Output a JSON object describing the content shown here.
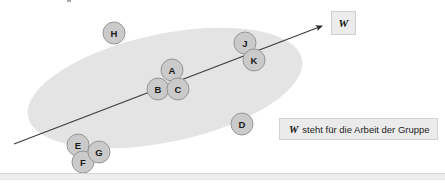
{
  "figure": {
    "type": "group-work-diagram",
    "background_color": "#ffffff",
    "group_region": {
      "shape": "ellipse",
      "name": "group-ellipse",
      "fill_color": "#e4e4e4",
      "center_x": 165,
      "center_y": 88,
      "radius_x": 140,
      "radius_y": 54,
      "rotation_deg": -12
    },
    "arrow": {
      "name": "work-vector-arrow",
      "label": "W",
      "color": "#3a3a3a",
      "start_x": 14,
      "start_y": 144,
      "end_x": 322,
      "end_y": 26
    },
    "nodes": [
      {
        "label": "H",
        "x": 114,
        "y": 33,
        "r": 11
      },
      {
        "label": "J",
        "x": 245,
        "y": 43,
        "r": 11
      },
      {
        "label": "K",
        "x": 254,
        "y": 60,
        "r": 11
      },
      {
        "label": "A",
        "x": 172,
        "y": 70,
        "r": 11
      },
      {
        "label": "B",
        "x": 158,
        "y": 89,
        "r": 11
      },
      {
        "label": "C",
        "x": 178,
        "y": 89,
        "r": 11
      },
      {
        "label": "D",
        "x": 242,
        "y": 124,
        "r": 11
      },
      {
        "label": "E",
        "x": 78,
        "y": 145,
        "r": 11
      },
      {
        "label": "F",
        "x": 83,
        "y": 162,
        "r": 11
      },
      {
        "label": "G",
        "x": 99,
        "y": 152,
        "r": 11
      }
    ],
    "node_style": {
      "fill_color": "#cacaca",
      "stroke_color": "#8f8f8f",
      "text_color": "#1a1a1a"
    }
  },
  "w_badge": {
    "name": "w-label-box",
    "text": "W"
  },
  "legend": {
    "name": "legend-caption",
    "symbol": "W",
    "text": "steht für die Arbeit der Gruppe",
    "full_text": "W steht für die Arbeit der Gruppe"
  }
}
